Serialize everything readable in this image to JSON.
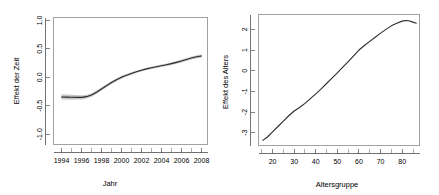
{
  "figure": {
    "name": "gam-smooth-effects-figure",
    "background": "#ffffff",
    "curve_color": "#2b2b2b",
    "band_color": "#b6b6b6",
    "axis_color": "#4d4d4d"
  },
  "chart_data": [
    {
      "id": "time-effect",
      "type": "line",
      "title": "",
      "xlabel": "Jahr",
      "ylabel": "Effekt der Zeit",
      "xlim": [
        1993.2,
        2008.6
      ],
      "ylim": [
        -1.18,
        1.05
      ],
      "grid": false,
      "legend": "none",
      "xticks": [
        1994,
        1996,
        1998,
        2000,
        2002,
        2004,
        2006,
        2008
      ],
      "xtick_labels": [
        "1994",
        "1996",
        "1998",
        "2000",
        "2002",
        "2004",
        "2006",
        "2008"
      ],
      "xminorticks": [
        1995,
        1997,
        1999,
        2001,
        2003,
        2005,
        2007
      ],
      "yticks": [
        -1.0,
        -0.5,
        0.0,
        0.5,
        1.0
      ],
      "ytick_labels": [
        "-1.0",
        "-0.5",
        "0.0",
        "0.5",
        "1.0"
      ],
      "series": [
        {
          "name": "Effekt der Zeit",
          "x": [
            1994.0,
            1994.5,
            1995.0,
            1995.5,
            1996.0,
            1996.5,
            1997.0,
            1997.5,
            1998.0,
            1998.5,
            1999.0,
            1999.5,
            2000.0,
            2000.5,
            2001.0,
            2001.5,
            2002.0,
            2002.5,
            2003.0,
            2003.5,
            2004.0,
            2004.5,
            2005.0,
            2005.5,
            2006.0,
            2006.5,
            2007.0,
            2007.5,
            2008.0
          ],
          "values": [
            -0.345,
            -0.348,
            -0.35,
            -0.352,
            -0.352,
            -0.34,
            -0.31,
            -0.262,
            -0.205,
            -0.148,
            -0.092,
            -0.042,
            0.0,
            0.036,
            0.068,
            0.098,
            0.124,
            0.148,
            0.168,
            0.186,
            0.202,
            0.22,
            0.24,
            0.262,
            0.286,
            0.312,
            0.338,
            0.36,
            0.375
          ]
        }
      ],
      "confidence_band": {
        "name": "approximate 95% confidence band",
        "lower": [
          -0.392,
          -0.392,
          -0.393,
          -0.392,
          -0.388,
          -0.374,
          -0.342,
          -0.292,
          -0.234,
          -0.176,
          -0.119,
          -0.068,
          -0.025,
          0.012,
          0.045,
          0.076,
          0.103,
          0.127,
          0.147,
          0.165,
          0.181,
          0.198,
          0.217,
          0.238,
          0.261,
          0.286,
          0.311,
          0.332,
          0.345
        ],
        "upper": [
          -0.298,
          -0.304,
          -0.307,
          -0.312,
          -0.316,
          -0.306,
          -0.278,
          -0.232,
          -0.176,
          -0.12,
          -0.065,
          -0.016,
          0.025,
          0.06,
          0.091,
          0.12,
          0.145,
          0.169,
          0.189,
          0.207,
          0.223,
          0.242,
          0.263,
          0.286,
          0.311,
          0.338,
          0.365,
          0.388,
          0.405
        ]
      }
    },
    {
      "id": "age-effect",
      "type": "line",
      "title": "",
      "xlabel": "Altersgruppe",
      "ylabel": "Effekt des Alters",
      "xlim": [
        13.5,
        88.0
      ],
      "ylim": [
        -3.62,
        2.72
      ],
      "grid": false,
      "legend": "none",
      "xticks": [
        20,
        30,
        40,
        50,
        60,
        70,
        80
      ],
      "xtick_labels": [
        "20",
        "30",
        "40",
        "50",
        "60",
        "70",
        "80"
      ],
      "xminorticks": [
        15,
        25,
        35,
        45,
        55,
        65,
        75,
        85
      ],
      "yticks": [
        -3,
        -2,
        -1,
        0,
        1,
        2
      ],
      "ytick_labels": [
        "-3",
        "-2",
        "-1",
        "0",
        "1",
        "2"
      ],
      "series": [
        {
          "name": "Effekt des Alters",
          "x": [
            15.5,
            17.5,
            20.0,
            22.5,
            25.0,
            27.5,
            30.0,
            32.5,
            35.0,
            37.5,
            40.0,
            42.5,
            45.0,
            47.5,
            50.0,
            52.5,
            55.0,
            57.5,
            60.0,
            62.5,
            65.0,
            67.5,
            70.0,
            72.5,
            75.0,
            77.5,
            80.0,
            81.5,
            83.0,
            85.0,
            86.5
          ],
          "values": [
            -3.37,
            -3.22,
            -2.96,
            -2.7,
            -2.44,
            -2.18,
            -1.95,
            -1.78,
            -1.58,
            -1.35,
            -1.12,
            -0.88,
            -0.62,
            -0.36,
            -0.1,
            0.17,
            0.44,
            0.72,
            1.0,
            1.22,
            1.42,
            1.62,
            1.82,
            2.0,
            2.17,
            2.3,
            2.4,
            2.43,
            2.42,
            2.35,
            2.3
          ]
        }
      ]
    }
  ]
}
